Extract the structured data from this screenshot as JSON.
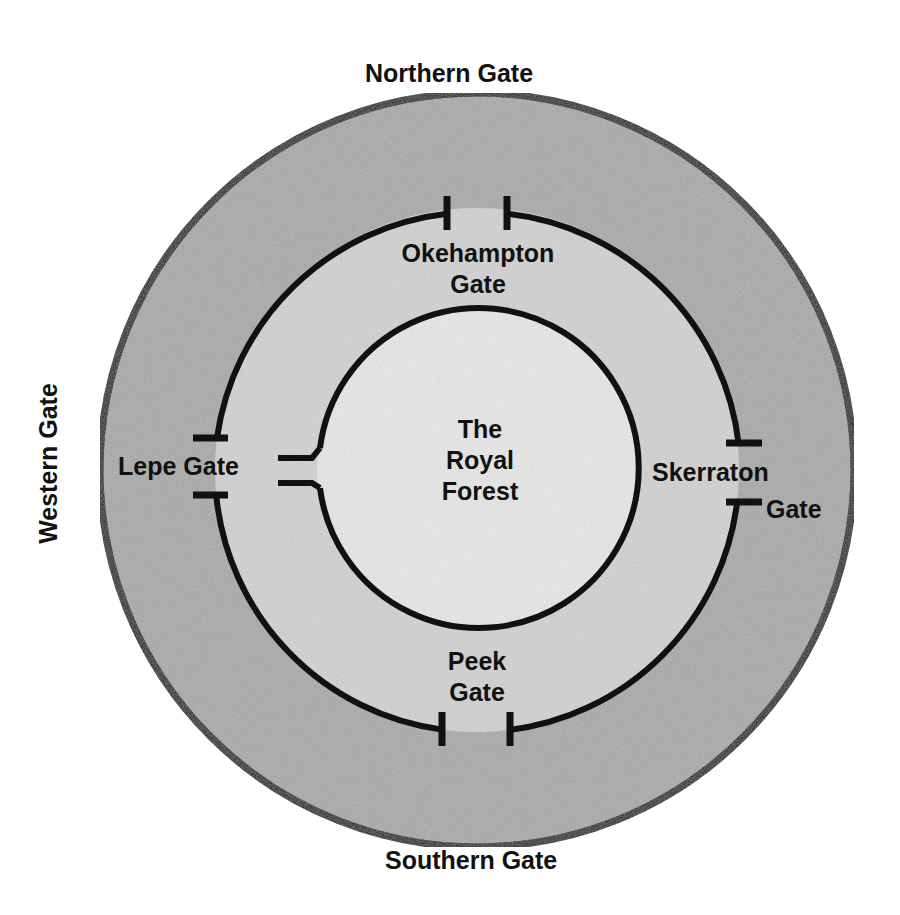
{
  "diagram": {
    "type": "concentric-rings",
    "colors": {
      "outer_ring": "#a9a9a9",
      "middle_ring": "#d3d3d3",
      "inner_circle": "#e9e9e9",
      "lines": "#111111",
      "background": "#ffffff"
    },
    "outer_labels": {
      "north": "Northern Gate",
      "south": "Southern Gate",
      "west": "Western Gate"
    },
    "middle_gates": {
      "north": [
        "Okehampton",
        "Gate"
      ],
      "south": [
        "Peek",
        "Gate"
      ],
      "west": "Lepe Gate",
      "east": [
        "Skerraton",
        "Gate"
      ]
    },
    "center": [
      "The",
      "Royal",
      "Forest"
    ]
  }
}
